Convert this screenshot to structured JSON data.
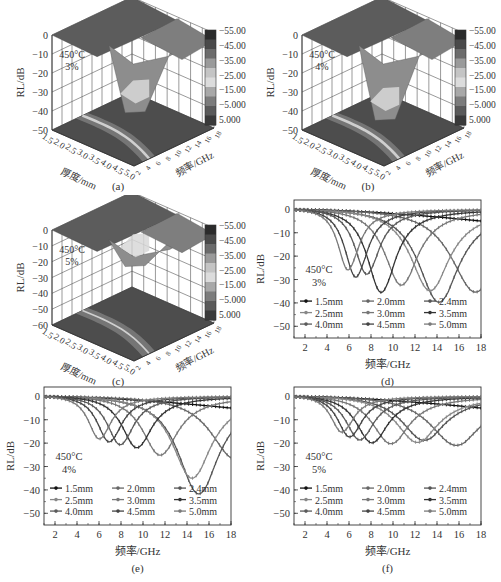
{
  "figure": {
    "panels": [
      "(a)",
      "(b)",
      "(c)",
      "(d)",
      "(e)",
      "(f)"
    ]
  },
  "colors": {
    "colorbar": [
      "#2b2b2b",
      "#4a4a4a",
      "#6b6b6b",
      "#9a9a9a",
      "#c4c4c4",
      "#dcdcdc",
      "#a8a8a8",
      "#7c7c7c",
      "#5a5a5a",
      "#3a3a3a"
    ],
    "axis": "#444444",
    "grid": "#555555",
    "series": [
      "#111111",
      "#666666",
      "#555555",
      "#888888",
      "#777777",
      "#333333",
      "#5a5a5a",
      "#444444",
      "#7a7a7a"
    ]
  },
  "chart_data": [
    {
      "id": "a",
      "type": "surface3d",
      "caption": "(a)",
      "annotation": [
        "450°C",
        "3%"
      ],
      "zlabel": "RL/dB",
      "xlabel": "厚度/mm",
      "ylabel": "频率/GHz",
      "zticks": [
        "0",
        "−10",
        "−20",
        "−30",
        "−40",
        "−50"
      ],
      "xticks": [
        "1.5",
        "2.0",
        "2.5",
        "3.0",
        "3.5",
        "4.0",
        "4.5",
        "5.0"
      ],
      "yticks": [
        "2",
        "4",
        "6",
        "8",
        "10",
        "12",
        "14",
        "16",
        "18"
      ],
      "colorbar_labels": [
        "−55.00",
        "−45.00",
        "−35.00",
        "−25.00",
        "−15.00",
        "−5.000",
        "5.000"
      ],
      "min_rl": -40
    },
    {
      "id": "b",
      "type": "surface3d",
      "caption": "(b)",
      "annotation": [
        "450°C",
        "4%"
      ],
      "zlabel": "RL/dB",
      "xlabel": "厚度/mm",
      "ylabel": "频率/GHz",
      "zticks": [
        "0",
        "−10",
        "−20",
        "−30",
        "−40",
        "−50"
      ],
      "xticks": [
        "1.5",
        "2.0",
        "2.5",
        "3.0",
        "3.5",
        "4.0",
        "4.5",
        "5.0"
      ],
      "yticks": [
        "2",
        "4",
        "6",
        "8",
        "10",
        "12",
        "14",
        "16",
        "18"
      ],
      "colorbar_labels": [
        "−55.00",
        "−45.00",
        "−35.00",
        "−25.00",
        "−15.00",
        "−5.000",
        "5.000"
      ],
      "min_rl": -44
    },
    {
      "id": "c",
      "type": "surface3d",
      "caption": "(c)",
      "annotation": [
        "450°C",
        "5%"
      ],
      "zlabel": "RL/dB",
      "xlabel": "厚度/mm",
      "ylabel": "频率/GHz",
      "zticks": [
        "0",
        "−10",
        "−20",
        "−30",
        "−40",
        "−50",
        "−60"
      ],
      "xticks": [
        "1.5",
        "2.0",
        "2.5",
        "3.0",
        "3.5",
        "4.0",
        "4.5",
        "5.0"
      ],
      "yticks": [
        "2",
        "4",
        "6",
        "8",
        "10",
        "12",
        "14",
        "16",
        "18"
      ],
      "colorbar_labels": [
        "−55.00",
        "−45.00",
        "−35.00",
        "−25.00",
        "−15.00",
        "−5.000",
        "5.000"
      ],
      "min_rl": -22
    },
    {
      "id": "d",
      "type": "line",
      "caption": "(d)",
      "annotation": [
        "450°C",
        "3%"
      ],
      "xlabel": "频率/GHz",
      "ylabel": "RL/dB",
      "xlim": [
        1,
        18
      ],
      "ylim": [
        -55,
        4
      ],
      "xticks": [
        2,
        4,
        6,
        8,
        10,
        12,
        14,
        16,
        18
      ],
      "yticks": [
        0,
        -10,
        -20,
        -30,
        -40,
        -50
      ],
      "legend": [
        "1.5mm",
        "2.0mm",
        "2.4mm",
        "2.5mm",
        "3.0mm",
        "3.5mm",
        "4.0mm",
        "4.5mm",
        "5.0mm"
      ],
      "series": [
        {
          "name": "1.5mm",
          "peak_freq": 25,
          "peak_rl": -5,
          "width": 8
        },
        {
          "name": "2.0mm",
          "peak_freq": 17.3,
          "peak_rl": -37,
          "width": 2.6
        },
        {
          "name": "2.4mm",
          "peak_freq": 14.0,
          "peak_rl": -42,
          "width": 2.2
        },
        {
          "name": "2.5mm",
          "peak_freq": 13.2,
          "peak_rl": -37,
          "width": 2.1
        },
        {
          "name": "3.0mm",
          "peak_freq": 10.6,
          "peak_rl": -35,
          "width": 1.8
        },
        {
          "name": "3.5mm",
          "peak_freq": 8.8,
          "peak_rl": -39,
          "width": 1.5
        },
        {
          "name": "4.0mm",
          "peak_freq": 7.5,
          "peak_rl": -31,
          "width": 1.3
        },
        {
          "name": "4.5mm",
          "peak_freq": 6.5,
          "peak_rl": -33,
          "width": 1.2
        },
        {
          "name": "5.0mm",
          "peak_freq": 5.8,
          "peak_rl": -30,
          "width": 1.1
        }
      ]
    },
    {
      "id": "e",
      "type": "line",
      "caption": "(e)",
      "annotation": [
        "450°C",
        "4%"
      ],
      "xlabel": "频率/GHz",
      "ylabel": "RL/dB",
      "xlim": [
        1,
        18
      ],
      "ylim": [
        -55,
        4
      ],
      "xticks": [
        2,
        4,
        6,
        8,
        10,
        12,
        14,
        16,
        18
      ],
      "yticks": [
        0,
        -10,
        -20,
        -30,
        -40,
        -50
      ],
      "legend": [
        "1.5mm",
        "2.0mm",
        "2.4mm",
        "2.5mm",
        "3.0mm",
        "3.5mm",
        "4.0mm",
        "4.5mm",
        "5.0mm"
      ],
      "series": [
        {
          "name": "1.5mm",
          "peak_freq": 25,
          "peak_rl": -5,
          "width": 8
        },
        {
          "name": "2.0mm",
          "peak_freq": 18.2,
          "peak_rl": -28,
          "width": 2.6
        },
        {
          "name": "2.4mm",
          "peak_freq": 14.9,
          "peak_rl": -44,
          "width": 2.2
        },
        {
          "name": "2.5mm",
          "peak_freq": 14.3,
          "peak_rl": -37,
          "width": 2.1
        },
        {
          "name": "3.0mm",
          "peak_freq": 11.4,
          "peak_rl": -27,
          "width": 1.9
        },
        {
          "name": "3.5mm",
          "peak_freq": 9.3,
          "peak_rl": -24,
          "width": 1.6
        },
        {
          "name": "4.0mm",
          "peak_freq": 7.8,
          "peak_rl": -23,
          "width": 1.4
        },
        {
          "name": "4.5mm",
          "peak_freq": 6.8,
          "peak_rl": -22,
          "width": 1.3
        },
        {
          "name": "5.0mm",
          "peak_freq": 5.9,
          "peak_rl": -21,
          "width": 1.2
        }
      ]
    },
    {
      "id": "f",
      "type": "line",
      "caption": "(f)",
      "annotation": [
        "450°C",
        "5%"
      ],
      "xlabel": "频率/GHz",
      "ylabel": "RL/dB",
      "xlim": [
        1,
        18
      ],
      "ylim": [
        -55,
        4
      ],
      "xticks": [
        2,
        4,
        6,
        8,
        10,
        12,
        14,
        16,
        18
      ],
      "yticks": [
        0,
        -10,
        -20,
        -30,
        -40,
        -50
      ],
      "legend": [
        "1.5mm",
        "2.0mm",
        "2.4mm",
        "2.5mm",
        "3.0mm",
        "3.5mm",
        "4.0mm",
        "4.5mm",
        "5.0mm"
      ],
      "series": [
        {
          "name": "1.5mm",
          "peak_freq": 25,
          "peak_rl": -5,
          "width": 8
        },
        {
          "name": "2.0mm",
          "peak_freq": 15.5,
          "peak_rl": -22,
          "width": 2.8
        },
        {
          "name": "2.4mm",
          "peak_freq": 12.6,
          "peak_rl": -20,
          "width": 2.4
        },
        {
          "name": "2.5mm",
          "peak_freq": 12.0,
          "peak_rl": -21,
          "width": 2.3
        },
        {
          "name": "3.0mm",
          "peak_freq": 9.6,
          "peak_rl": -22,
          "width": 2.0
        },
        {
          "name": "3.5mm",
          "peak_freq": 7.9,
          "peak_rl": -22,
          "width": 1.7
        },
        {
          "name": "4.0mm",
          "peak_freq": 6.8,
          "peak_rl": -21,
          "width": 1.5
        },
        {
          "name": "4.5mm",
          "peak_freq": 5.9,
          "peak_rl": -20,
          "width": 1.3
        },
        {
          "name": "5.0mm",
          "peak_freq": 5.2,
          "peak_rl": -18,
          "width": 1.2
        }
      ]
    }
  ]
}
